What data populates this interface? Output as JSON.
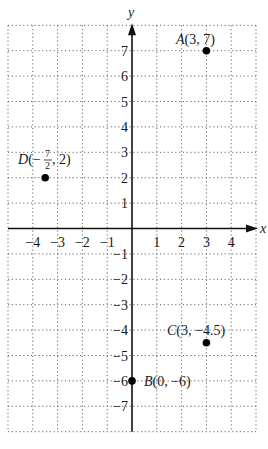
{
  "chart_data": {
    "type": "scatter",
    "title": "",
    "xlabel": "x",
    "ylabel": "y",
    "xlim": [
      -5,
      5
    ],
    "ylim": [
      -8,
      8
    ],
    "grid": true,
    "grid_style": "dotted",
    "x_ticks": [
      "−4",
      "−3",
      "−2",
      "−1",
      "1",
      "2",
      "3",
      "4"
    ],
    "x_tick_values": [
      -4,
      -3,
      -2,
      -1,
      1,
      2,
      3,
      4
    ],
    "y_ticks": [
      "7",
      "6",
      "5",
      "4",
      "3",
      "2",
      "1",
      "−1",
      "−2",
      "−3",
      "−4",
      "−5",
      "−6",
      "−7"
    ],
    "y_tick_values": [
      7,
      6,
      5,
      4,
      3,
      2,
      1,
      -1,
      -2,
      -3,
      -4,
      -5,
      -6,
      -7
    ],
    "points": [
      {
        "name": "A",
        "x": 3,
        "y": 7,
        "label": "A(3, 7)"
      },
      {
        "name": "B",
        "x": 0,
        "y": -6,
        "label": "B(0, −6)"
      },
      {
        "name": "C",
        "x": 3,
        "y": -4.5,
        "label": "C(3, −4.5)"
      },
      {
        "name": "D",
        "x": -3.5,
        "y": 2,
        "label": "D(−7/2, 2)"
      }
    ]
  },
  "labels": {
    "x_axis": "x",
    "y_axis": "y",
    "A_letter": "A",
    "A_coords": "(3, 7)",
    "B_letter": "B",
    "B_coords": "(0, −6)",
    "C_letter": "C",
    "C_coords": "(3, −4.5)",
    "D_letter": "D",
    "D_open": "(−",
    "D_num": "7",
    "D_den": "2",
    "D_close": ", 2)"
  }
}
